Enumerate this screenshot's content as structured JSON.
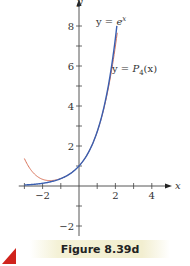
{
  "chart_data": {
    "type": "line",
    "title": "",
    "xlabel": "x",
    "ylabel": "y",
    "xlim": [
      -3.2,
      5.0
    ],
    "ylim": [
      -2.6,
      9.2
    ],
    "x_ticks": [
      -3,
      -2,
      -1,
      1,
      2,
      3,
      4
    ],
    "x_tick_labels": [
      {
        "value": -2,
        "label": "−2"
      },
      {
        "value": 2,
        "label": "2"
      },
      {
        "value": 4,
        "label": "4"
      }
    ],
    "y_ticks": [
      -2,
      -1,
      1,
      2,
      3,
      4,
      5,
      6,
      7,
      8
    ],
    "y_tick_labels": [
      {
        "value": -2,
        "label": "−2"
      },
      {
        "value": 2,
        "label": "2"
      },
      {
        "value": 4,
        "label": "4"
      },
      {
        "value": 6,
        "label": "6"
      },
      {
        "value": 8,
        "label": "8"
      }
    ],
    "grid": false,
    "series": [
      {
        "name": "y = e^x",
        "label": "y = e",
        "label_sup": "x",
        "color": "#3a5fb0",
        "function": "exp",
        "x_range": [
          -3,
          2.08
        ],
        "points": [
          [
            -3,
            0.05
          ],
          [
            -2,
            0.135
          ],
          [
            -1,
            0.368
          ],
          [
            0,
            1
          ],
          [
            1,
            2.718
          ],
          [
            1.5,
            4.48
          ],
          [
            2,
            7.39
          ],
          [
            2.08,
            8.0
          ]
        ]
      },
      {
        "name": "y = P4(x)",
        "label": "y = ",
        "label_fn": "P",
        "label_sub": "4",
        "label_arg": "(x)",
        "color": "#d9735a",
        "function": "taylor4_exp",
        "x_range": [
          -3,
          2.1
        ],
        "points": [
          [
            -3,
            1.375
          ],
          [
            -2,
            0.333
          ],
          [
            -1,
            0.375
          ],
          [
            0,
            1
          ],
          [
            1,
            2.708
          ],
          [
            1.5,
            4.398
          ],
          [
            2,
            7.0
          ],
          [
            2.1,
            7.74
          ]
        ]
      }
    ]
  },
  "caption": {
    "text": "Figure 8.39d",
    "accent_color": "#d0231c"
  }
}
